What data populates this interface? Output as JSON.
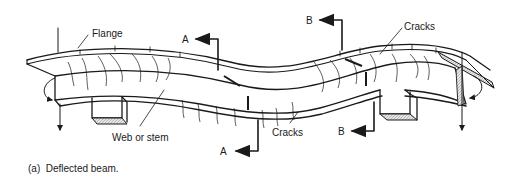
{
  "diagram": {
    "caption": "(a)  Deflected beam.",
    "labels": {
      "flange": "Flange",
      "web": "Web or stem",
      "cracks_top": "Cracks",
      "cracks_bottom": "Cracks",
      "section_a_top": "A",
      "section_a_bottom": "A",
      "section_b_top": "B",
      "section_b_bottom": "B"
    },
    "colors": {
      "line": "#1a1a1a",
      "hatch": "#cfcfcf",
      "background": "#ffffff"
    }
  }
}
